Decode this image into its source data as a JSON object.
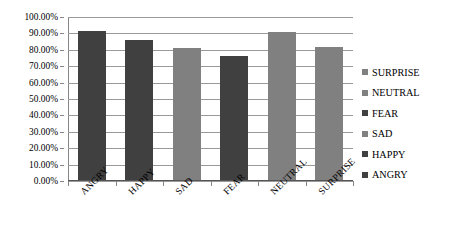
{
  "chart_data": {
    "type": "bar",
    "title": "",
    "xlabel": "",
    "ylabel": "",
    "categories": [
      "ANGRY",
      "HAPPY",
      "SAD",
      "FEAR",
      "NEUTRAL",
      "SURPRISE"
    ],
    "values": [
      91.5,
      86.0,
      81.0,
      76.0,
      91.0,
      81.5
    ],
    "value_labels": [
      "91.50%",
      "86.00%",
      "81.00%",
      "76.00%",
      "91.00%",
      "81.50%"
    ],
    "ylim": [
      0,
      100
    ],
    "ytick_values": [
      0,
      10,
      20,
      30,
      40,
      50,
      60,
      70,
      80,
      90,
      100
    ],
    "ytick_labels": [
      "0.00%",
      "10.00%",
      "20.00%",
      "30.00%",
      "40.00%",
      "50.00%",
      "60.00%",
      "70.00%",
      "80.00%",
      "90.00%",
      "100.00%"
    ],
    "grid": true,
    "legend_position": "right",
    "legend": [
      {
        "label": "SURPRISE",
        "color": "#808080"
      },
      {
        "label": "NEUTRAL",
        "color": "#808080"
      },
      {
        "label": "FEAR",
        "color": "#404040"
      },
      {
        "label": "SAD",
        "color": "#808080"
      },
      {
        "label": "HAPPY",
        "color": "#404040"
      },
      {
        "label": "ANGRY",
        "color": "#404040"
      }
    ],
    "bar_colors": [
      "#404040",
      "#404040",
      "#808080",
      "#404040",
      "#808080",
      "#808080"
    ],
    "colors": {
      "dark_bar": "#404040",
      "light_bar": "#808080",
      "gridline": "#9a9a9a",
      "axis": "#555555",
      "text": "#000000",
      "background": "#ffffff"
    }
  }
}
